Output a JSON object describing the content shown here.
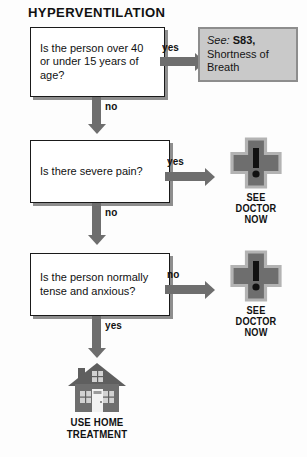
{
  "title": "HYPERVENTILATION",
  "flow": {
    "steps": [
      {
        "id": "step-1",
        "question": "Is the person over 40\nor under 15 years of\nage?",
        "side_branch_label": "yes",
        "down_branch_label": "no"
      },
      {
        "id": "step-2",
        "question": "Is there severe pain?",
        "side_branch_label": "yes",
        "down_branch_label": "no"
      },
      {
        "id": "step-3",
        "question": "Is the person normally\ntense and anxious?",
        "side_branch_label": "no",
        "down_branch_label": "yes"
      }
    ],
    "reference": {
      "see_word": "See:",
      "code": "S83,",
      "description": "Shortness of\nBreath"
    },
    "outcomes": [
      {
        "id": "outcome-doctor-1",
        "icon": "medical-cross-alert-icon",
        "label": "SEE\nDOCTOR\nNOW"
      },
      {
        "id": "outcome-doctor-2",
        "icon": "medical-cross-alert-icon",
        "label": "SEE\nDOCTOR\nNOW"
      },
      {
        "id": "outcome-home",
        "icon": "house-icon",
        "label": "USE HOME\nTREATMENT"
      }
    ]
  },
  "colors": {
    "arrow": "#6e6e6e",
    "icon_fill": "#6e6e6e",
    "icon_outline": "#b3b3b3",
    "box_border": "#1a1a1a",
    "box_shadow": "#8e8e8e",
    "reference_bg": "#c9c9c9",
    "reference_border": "#8d8d8d",
    "text": "#111111"
  }
}
